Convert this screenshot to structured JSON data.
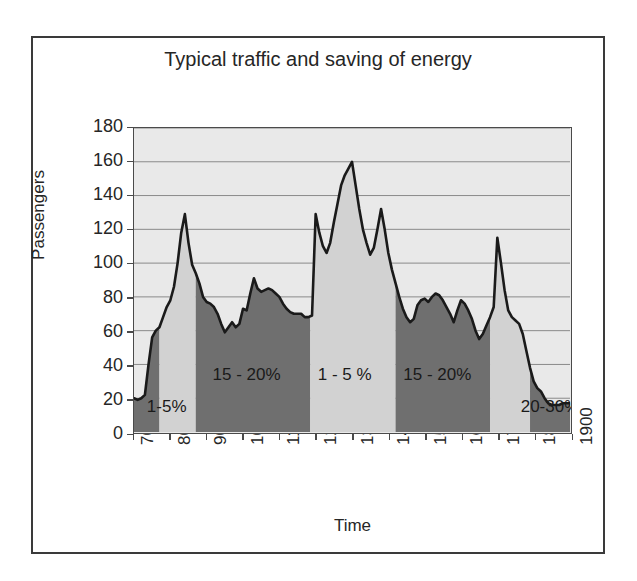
{
  "chart_data": {
    "type": "area",
    "title": "Typical traffic and saving of energy",
    "xlabel": "Time",
    "ylabel": "Passengers",
    "xlim": [
      700,
      1900
    ],
    "ylim": [
      0,
      180
    ],
    "grid": true,
    "legend": "none",
    "x_tick_labels": [
      "700",
      "800",
      "900",
      "1000",
      "1100",
      "1200",
      "1300",
      "1400",
      "1500",
      "1600",
      "1700",
      "1800",
      "1900"
    ],
    "y_tick_labels": [
      "0",
      "20",
      "40",
      "60",
      "80",
      "100",
      "120",
      "140",
      "160",
      "180"
    ],
    "x": [
      700,
      710,
      720,
      730,
      740,
      750,
      760,
      770,
      780,
      790,
      800,
      810,
      820,
      830,
      840,
      850,
      860,
      870,
      880,
      890,
      900,
      910,
      920,
      930,
      940,
      950,
      960,
      970,
      980,
      990,
      1000,
      1010,
      1020,
      1030,
      1040,
      1050,
      1060,
      1070,
      1080,
      1090,
      1100,
      1110,
      1120,
      1130,
      1140,
      1150,
      1160,
      1170,
      1180,
      1190,
      1200,
      1210,
      1220,
      1230,
      1240,
      1250,
      1260,
      1270,
      1280,
      1290,
      1300,
      1310,
      1320,
      1330,
      1340,
      1350,
      1360,
      1370,
      1380,
      1390,
      1400,
      1410,
      1420,
      1430,
      1440,
      1450,
      1460,
      1470,
      1480,
      1490,
      1500,
      1510,
      1520,
      1530,
      1540,
      1550,
      1560,
      1570,
      1580,
      1590,
      1600,
      1610,
      1620,
      1630,
      1640,
      1650,
      1660,
      1670,
      1680,
      1690,
      1700,
      1710,
      1720,
      1730,
      1740,
      1750,
      1760,
      1770,
      1780,
      1790,
      1800,
      1810,
      1820,
      1830,
      1840,
      1850,
      1860,
      1870,
      1880,
      1890,
      1900
    ],
    "y": [
      20,
      19,
      20,
      22,
      40,
      56,
      60,
      62,
      68,
      74,
      78,
      86,
      100,
      118,
      129,
      112,
      99,
      94,
      88,
      80,
      77,
      76,
      74,
      70,
      64,
      59,
      62,
      65,
      62,
      64,
      73,
      72,
      82,
      91,
      85,
      83,
      84,
      85,
      84,
      82,
      80,
      76,
      73,
      71,
      70,
      70,
      70,
      68,
      68,
      69,
      129,
      118,
      110,
      106,
      112,
      124,
      135,
      146,
      152,
      156,
      160,
      146,
      132,
      120,
      112,
      105,
      109,
      120,
      132,
      120,
      106,
      96,
      88,
      80,
      73,
      68,
      65,
      67,
      75,
      78,
      79,
      77,
      80,
      82,
      81,
      78,
      74,
      70,
      65,
      72,
      78,
      76,
      72,
      67,
      60,
      55,
      58,
      63,
      68,
      74,
      115,
      100,
      84,
      72,
      68,
      66,
      64,
      58,
      48,
      38,
      30,
      26,
      24,
      20,
      17,
      16,
      16,
      16,
      17,
      17,
      17
    ],
    "series_name": "Passengers",
    "bands": [
      {
        "label": "1-5%",
        "x_start": 700,
        "x_end": 770,
        "shade": "dark"
      },
      {
        "label": "1-5%",
        "x_start": 770,
        "x_end": 870,
        "shade": "light"
      },
      {
        "label": "15 - 20%",
        "x_start": 870,
        "x_end": 1185,
        "shade": "dark"
      },
      {
        "label": "1 - 5 %",
        "x_start": 1185,
        "x_end": 1420,
        "shade": "light"
      },
      {
        "label": "15 - 20%",
        "x_start": 1420,
        "x_end": 1680,
        "shade": "dark"
      },
      {
        "label": "",
        "x_start": 1680,
        "x_end": 1790,
        "shade": "light"
      },
      {
        "label": "20-30%",
        "x_start": 1790,
        "x_end": 1900,
        "shade": "dark"
      }
    ],
    "annotations": [
      {
        "text": "1-5%",
        "x": 790,
        "y": 14
      },
      {
        "text": "15 - 20%",
        "x": 1010,
        "y": 33
      },
      {
        "text": "1 - 5 %",
        "x": 1280,
        "y": 33
      },
      {
        "text": "15 - 20%",
        "x": 1535,
        "y": 33
      },
      {
        "text": "20-30%",
        "x": 1845,
        "y": 14
      }
    ],
    "colors": {
      "dark_fill": "#6f6f6f",
      "light_fill": "#d2d2d2",
      "plot_background": "#e9e9e9",
      "gridline": "#8a8a8a",
      "line": "#1a1a1a",
      "frame": "#3a3a3a",
      "text": "#262626"
    }
  }
}
